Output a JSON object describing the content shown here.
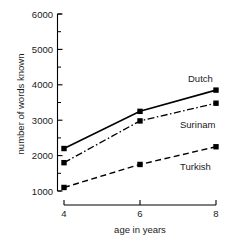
{
  "chart_data": {
    "type": "line",
    "title": "",
    "xlabel": "age in years",
    "ylabel": "number of words known",
    "x": [
      4,
      6,
      8
    ],
    "xtick_labels": [
      "4",
      "6",
      "8"
    ],
    "ytick_labels": [
      "1000",
      "2000",
      "3000",
      "4000",
      "5000",
      "6000"
    ],
    "ytick_values": [
      1000,
      2000,
      3000,
      4000,
      5000,
      6000
    ],
    "yminor_values": [
      1500,
      2500,
      3500,
      4500,
      5500
    ],
    "xlim": [
      4,
      8
    ],
    "ylim": [
      1000,
      6000
    ],
    "grid": false,
    "legend_position": "inline-right",
    "series": [
      {
        "name": "Dutch",
        "values": [
          2200,
          3250,
          3850
        ],
        "linestyle": "solid",
        "marker": "square",
        "color": "#000000"
      },
      {
        "name": "Surinam",
        "values": [
          1800,
          2980,
          3480
        ],
        "linestyle": "dash-dot",
        "marker": "square",
        "color": "#000000"
      },
      {
        "name": "Turkish",
        "values": [
          1100,
          1750,
          2250
        ],
        "linestyle": "dashed",
        "marker": "square",
        "color": "#000000"
      }
    ]
  },
  "axes": {
    "y_axis_title": "number of words known",
    "x_axis_title": "age in years"
  },
  "labels": {
    "y_6000": "6000",
    "y_5000": "5000",
    "y_4000": "4000",
    "y_3000": "3000",
    "y_2000": "2000",
    "y_1000": "1000",
    "x_4": "4",
    "x_6": "6",
    "x_8": "8",
    "series_dutch": "Dutch",
    "series_surinam": "Surinam",
    "series_turkish": "Turkish"
  },
  "colors": {
    "ink": "#000000",
    "background": "#ffffff"
  }
}
